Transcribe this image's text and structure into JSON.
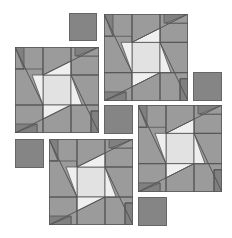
{
  "colors": {
    "background": "#ffffff",
    "medium": "#9b9b9b",
    "dark": "#808080",
    "center": "#e2e2e2",
    "light": "#efefef",
    "line": "#555555",
    "small_square": "#858585"
  },
  "blocks": [
    {
      "name": "block-top-left",
      "x": 15,
      "y": 47,
      "w": 84,
      "h": 86
    },
    {
      "name": "block-top-right",
      "x": 104,
      "y": 14,
      "w": 84,
      "h": 87
    },
    {
      "name": "block-bottom-left",
      "x": 49,
      "y": 139,
      "w": 84,
      "h": 86
    },
    {
      "name": "block-bottom-right",
      "x": 138,
      "y": 105,
      "w": 84,
      "h": 87
    }
  ],
  "squares": [
    {
      "name": "square-top",
      "x": 69,
      "y": 13,
      "w": 28,
      "h": 28
    },
    {
      "name": "square-right",
      "x": 193,
      "y": 72,
      "w": 29,
      "h": 29
    },
    {
      "name": "square-center",
      "x": 104,
      "y": 105,
      "w": 29,
      "h": 29
    },
    {
      "name": "square-left",
      "x": 15,
      "y": 139,
      "w": 29,
      "h": 29
    },
    {
      "name": "square-bottom",
      "x": 138,
      "y": 197,
      "w": 29,
      "h": 29
    }
  ]
}
